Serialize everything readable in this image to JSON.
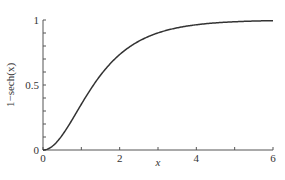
{
  "chart_data": {
    "type": "line",
    "title": "",
    "xlabel": "x",
    "ylabel": "1−sech(x)",
    "xlim": [
      0,
      6
    ],
    "ylim": [
      0,
      1
    ],
    "x_ticks": [
      0,
      1,
      2,
      3,
      4,
      5,
      6
    ],
    "x_tick_labels": [
      "0",
      "",
      "2",
      "",
      "4",
      "",
      "6"
    ],
    "y_ticks": [
      0,
      0.1,
      0.2,
      0.3,
      0.4,
      0.5,
      0.6,
      0.7,
      0.8,
      0.9,
      1
    ],
    "y_tick_labels": [
      "0",
      "",
      "",
      "",
      "",
      "0.5",
      "",
      "",
      "",
      "",
      "1"
    ],
    "grid": false,
    "legend": null,
    "series": [
      {
        "name": "1−sech(x)",
        "color": "#333333",
        "x": [
          0,
          0.25,
          0.5,
          0.75,
          1,
          1.25,
          1.5,
          1.75,
          2,
          2.25,
          2.5,
          2.75,
          3,
          3.25,
          3.5,
          3.75,
          4,
          4.5,
          5,
          5.5,
          6
        ],
        "y": [
          0,
          0.031,
          0.113,
          0.228,
          0.352,
          0.47,
          0.575,
          0.663,
          0.734,
          0.791,
          0.837,
          0.873,
          0.901,
          0.923,
          0.94,
          0.953,
          0.963,
          0.978,
          0.987,
          0.992,
          0.995
        ]
      }
    ]
  }
}
